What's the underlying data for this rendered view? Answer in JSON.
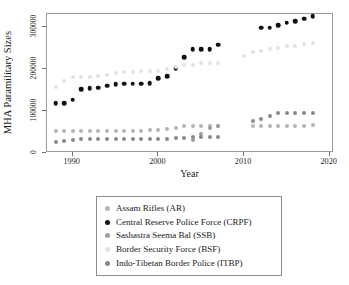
{
  "chart_data": {
    "type": "scatter",
    "title": "",
    "xlabel": "Year",
    "ylabel": "MHA Paramilitary Sizes",
    "xlim": [
      1987,
      2020.5
    ],
    "ylim": [
      0,
      330000
    ],
    "xticks": [
      1990,
      2000,
      2010,
      2020
    ],
    "yticks": [
      0,
      100000,
      200000,
      300000
    ],
    "ytick_labels": [
      "0",
      "100000",
      "200000",
      "300000"
    ],
    "xtick_labels": [
      "1990",
      "2000",
      "2010",
      "2020"
    ],
    "grid": false,
    "legend_position": "below-plot",
    "series": [
      {
        "name": "Assam Rifles (AR)",
        "short": "AR",
        "color": "#b4b4b4",
        "x": [
          1988,
          1989,
          1990,
          1991,
          1992,
          1993,
          1994,
          1995,
          1996,
          1997,
          1998,
          1999,
          2000,
          2001,
          2002,
          2003,
          2004,
          2005,
          2006,
          2007,
          2011,
          2012,
          2013,
          2014,
          2015,
          2016,
          2017,
          2018
        ],
        "y": [
          52000,
          53000,
          53000,
          53000,
          53000,
          53000,
          53000,
          53000,
          53000,
          53000,
          53000,
          54000,
          55000,
          57000,
          60000,
          63000,
          63000,
          63000,
          64000,
          64000,
          64000,
          64000,
          65000,
          65000,
          65000,
          65000,
          65000,
          66000
        ]
      },
      {
        "name": "Central Reserve Police Force (CRPF)",
        "short": "CRPF",
        "color": "#111111",
        "x": [
          1988,
          1989,
          1990,
          1991,
          1992,
          1993,
          1994,
          1995,
          1996,
          1997,
          1998,
          1999,
          2000,
          2001,
          2002,
          2003,
          2004,
          2005,
          2006,
          2007,
          2012,
          2013,
          2014,
          2015,
          2016,
          2017,
          2018
        ],
        "y": [
          118000,
          118000,
          127000,
          152000,
          154000,
          155000,
          160000,
          164000,
          165000,
          165000,
          165000,
          166000,
          177000,
          182000,
          202000,
          227000,
          247000,
          247000,
          247000,
          257000,
          297000,
          297000,
          303000,
          309000,
          313000,
          319000,
          325000
        ]
      },
      {
        "name": "Sashastra Seema Bal (SSB)",
        "short": "SSB",
        "color": "#9e9e9e",
        "x": [
          2004,
          2005,
          2006,
          2007
        ],
        "y": [
          31000,
          46000,
          59000,
          63000
        ]
      },
      {
        "name": "Border Security Force (BSF)",
        "short": "BSF",
        "color": "#e2e2e2",
        "x": [
          1988,
          1989,
          1990,
          1991,
          1992,
          1993,
          1994,
          1995,
          1996,
          1997,
          1998,
          1999,
          2000,
          2001,
          2002,
          2003,
          2004,
          2005,
          2006,
          2007,
          2010,
          2011,
          2012,
          2013,
          2014,
          2015,
          2016,
          2017,
          2018
        ],
        "y": [
          156000,
          170000,
          180000,
          180000,
          180000,
          182000,
          185000,
          190000,
          192000,
          193000,
          195000,
          195000,
          195000,
          200000,
          205000,
          208000,
          210000,
          213000,
          213000,
          213000,
          230000,
          240000,
          243000,
          246000,
          250000,
          253000,
          255000,
          258000,
          262000
        ]
      },
      {
        "name": "Indo-Tibetan Border Police (ITBP)",
        "short": "ITBP",
        "color": "#8a8a8a",
        "x": [
          1988,
          1989,
          1990,
          1991,
          1992,
          1993,
          1994,
          1995,
          1996,
          1997,
          1998,
          1999,
          2000,
          2001,
          2002,
          2003,
          2004,
          2005,
          2006,
          2007,
          2011,
          2012,
          2013,
          2014,
          2015,
          2016,
          2017,
          2018
        ],
        "y": [
          25000,
          29000,
          32000,
          33000,
          33000,
          33000,
          33000,
          33000,
          33000,
          33000,
          33000,
          33000,
          33000,
          34000,
          35000,
          36000,
          37000,
          37000,
          38000,
          38000,
          77000,
          81000,
          88000,
          94000,
          94000,
          94000,
          94000,
          96000
        ]
      }
    ]
  },
  "legend": {
    "items": [
      {
        "label": "Assam Rifles (AR)",
        "color": "#b4b4b4"
      },
      {
        "label": "Central Reserve Police Force (CRPF)",
        "color": "#111111"
      },
      {
        "label": "Sashastra Seema Bal (SSB)",
        "color": "#9e9e9e"
      },
      {
        "label": "Border Security Force (BSF)",
        "color": "#e2e2e2"
      },
      {
        "label": "Indo-Tibetan Border Police (ITBP)",
        "color": "#8a8a8a"
      }
    ]
  }
}
